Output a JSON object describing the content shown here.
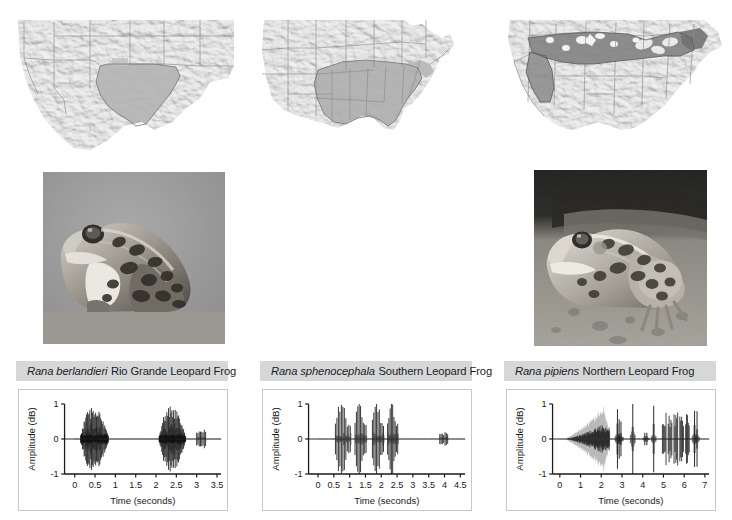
{
  "figure": {
    "panel_count": 3
  },
  "columns": [
    {
      "id": "rio-grande",
      "map": {
        "name": "range-map-rio-grande-leopard-frog",
        "region_description": "Southwestern United States and northern Mexico; shaded range covers Texas and the Rio Grande valley",
        "shade_color": "#b9b9b9",
        "base_color": "#e3e3e3"
      },
      "photo": {
        "name": "photo-rio-grande-leopard-frog",
        "alt": "Rio Grande leopard frog in profile on gray ground",
        "background_color": "#9a9a9a"
      },
      "caption": {
        "scientific_name": "Rana berlandieri",
        "common_name": "Rio Grande Leopard Frog"
      },
      "chart_data": {
        "type": "line",
        "title": "",
        "xlabel": "Time (seconds)",
        "ylabel": "Amplitude (dB)",
        "xlim": [
          -0.25,
          3.6
        ],
        "ylim": [
          -1,
          1
        ],
        "xticks": [
          0,
          0.5,
          1,
          1.5,
          2,
          2.5,
          3,
          3.5
        ],
        "xtick_labels": [
          "0",
          "0.5",
          "1",
          "1.5",
          "2",
          "2.5",
          "3",
          "3.5"
        ],
        "yticks": [
          -1,
          0,
          1
        ],
        "ytick_labels": [
          "-1",
          "0",
          "1"
        ],
        "grid": false,
        "legend": "none",
        "series": [
          {
            "name": "call-waveform",
            "description": "Pulsed chuckle call: first long pulse train 0.15-0.82 s, second train 2.08-2.72 s, short burst 3.0-3.22 s",
            "bursts": [
              {
                "start": 0.15,
                "end": 0.82,
                "peak_amplitude": 0.78,
                "pulse_count": 34,
                "envelope": "rise-to-middle"
              },
              {
                "start": 2.08,
                "end": 2.72,
                "peak_amplitude": 0.8,
                "pulse_count": 32,
                "envelope": "rise-to-middle"
              },
              {
                "start": 3.0,
                "end": 3.22,
                "peak_amplitude": 0.24,
                "pulse_count": 8,
                "envelope": "flat"
              }
            ]
          }
        ]
      }
    },
    {
      "id": "southern",
      "map": {
        "name": "range-map-southern-leopard-frog",
        "region_description": "Eastern United States; shaded range covers the southeastern states from Texas to Florida north to the Ohio valley and mid-Atlantic",
        "shade_color": "#b0b0b0",
        "base_color": "#e3e3e3"
      },
      "photo": {
        "name": "photo-southern-leopard-frog",
        "alt": "Southern leopard frog on sandy ground with dark background",
        "background_color": "#8d8d8d"
      },
      "caption": {
        "scientific_name": "Rana sphenocephala",
        "common_name": "Southern Leopard Frog"
      },
      "chart_data": {
        "type": "line",
        "title": "",
        "xlabel": "Time (seconds)",
        "ylabel": "Amplitude (dB)",
        "xlim": [
          -0.3,
          4.65
        ],
        "ylim": [
          -1,
          1
        ],
        "xticks": [
          0,
          0.5,
          1,
          1.5,
          2,
          2.5,
          3,
          3.5,
          4,
          4.5
        ],
        "xtick_labels": [
          "0",
          "0.5",
          "1",
          "1.5",
          "2",
          "2.5",
          "3",
          "3.5",
          "4",
          "4.5"
        ],
        "yticks": [
          -1,
          0,
          1
        ],
        "ytick_labels": [
          "-1",
          "0",
          "1"
        ],
        "grid": false,
        "legend": "none",
        "series": [
          {
            "name": "call-waveform",
            "description": "Four chuckle groups of tall discrete pulses between 0.55 and 2.5 s, then a low short burst near 3.85-4.1 s",
            "bursts": [
              {
                "start": 0.55,
                "end": 1.02,
                "peak_amplitude": 0.98,
                "pulse_count": 11,
                "envelope": "spiky"
              },
              {
                "start": 1.17,
                "end": 1.52,
                "peak_amplitude": 0.95,
                "pulse_count": 9,
                "envelope": "spiky"
              },
              {
                "start": 1.72,
                "end": 2.07,
                "peak_amplitude": 0.97,
                "pulse_count": 9,
                "envelope": "spiky"
              },
              {
                "start": 2.2,
                "end": 2.52,
                "peak_amplitude": 0.96,
                "pulse_count": 9,
                "envelope": "spiky"
              },
              {
                "start": 3.85,
                "end": 4.1,
                "peak_amplitude": 0.2,
                "pulse_count": 7,
                "envelope": "flat"
              }
            ]
          }
        ]
      }
    },
    {
      "id": "northern",
      "map": {
        "name": "range-map-northern-leopard-frog",
        "region_description": "Northern United States and southern Canada; shaded range spans the northern plains, Great Lakes, New England and the Rocky Mountain west",
        "shade_color": "#8f8f8f",
        "base_color": "#e3e3e3"
      },
      "photo": {
        "name": "photo-northern-leopard-frog",
        "alt": "Northern leopard frog sitting on moss",
        "background_color": "#3a3a3a"
      },
      "caption": {
        "scientific_name": "Rana pipiens",
        "common_name": "Northern Leopard Frog"
      },
      "chart_data": {
        "type": "line",
        "title": "",
        "xlabel": "Time (seconds)",
        "ylabel": "Amplitude (dB)",
        "xlim": [
          -0.35,
          7.2
        ],
        "ylim": [
          -1,
          1
        ],
        "xticks": [
          0,
          1,
          2,
          3,
          4,
          5,
          6,
          7
        ],
        "xtick_labels": [
          "0",
          "1",
          "2",
          "3",
          "4",
          "5",
          "6",
          "7"
        ],
        "yticks": [
          -1,
          0,
          1
        ],
        "ytick_labels": [
          "-1",
          "0",
          "1"
        ],
        "grid": false,
        "legend": "none",
        "series": [
          {
            "name": "call-waveform",
            "description": "Long low snore from 0.2 to 2.4 s rising to full amplitude, followed by isolated chuckle clicks at 2.8, 3.5, 4.5 s and a cluster of grunts from 4.9 to 6.6 s",
            "bursts": [
              {
                "start": 0.2,
                "end": 2.4,
                "peak_amplitude": 0.95,
                "pulse_count": 90,
                "envelope": "slow-rise-snore"
              },
              {
                "start": 2.78,
                "end": 2.95,
                "peak_amplitude": 0.85,
                "pulse_count": 3,
                "envelope": "click"
              },
              {
                "start": 3.48,
                "end": 3.56,
                "peak_amplitude": 1.0,
                "pulse_count": 1,
                "envelope": "click"
              },
              {
                "start": 4.1,
                "end": 4.2,
                "peak_amplitude": 0.18,
                "pulse_count": 2,
                "envelope": "click"
              },
              {
                "start": 4.48,
                "end": 4.58,
                "peak_amplitude": 0.95,
                "pulse_count": 1,
                "envelope": "click"
              },
              {
                "start": 4.95,
                "end": 6.35,
                "peak_amplitude": 0.72,
                "pulse_count": 22,
                "envelope": "grunt-cluster"
              },
              {
                "start": 6.5,
                "end": 6.62,
                "peak_amplitude": 0.8,
                "pulse_count": 2,
                "envelope": "click"
              }
            ]
          }
        ]
      }
    }
  ]
}
